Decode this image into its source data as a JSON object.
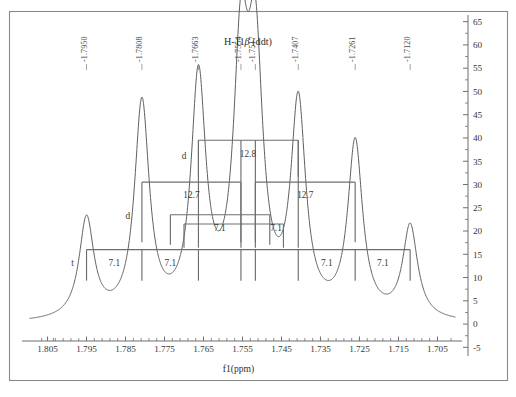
{
  "figure": {
    "title": "",
    "assignment_label": "H-11β (ddt)"
  },
  "axes": {
    "x": {
      "title": "f1(ppm)",
      "tick_labels": [
        "1.805",
        "1.795",
        "1.785",
        "1.775",
        "1.765",
        "1.755",
        "1.745",
        "1.735",
        "1.725",
        "1.715",
        "1.705"
      ],
      "min": 1.8095,
      "max": 1.7005,
      "direction": "reversed",
      "minor_ticks_per_major": 4
    },
    "y": {
      "title": "",
      "tick_labels": [
        "-5",
        "0",
        "5",
        "10",
        "15",
        "20",
        "25",
        "30",
        "35",
        "40",
        "45",
        "50",
        "55",
        "60",
        "65"
      ],
      "min": -6,
      "max": 66,
      "minor_ticks_per_major": 1
    }
  },
  "peak_labels": [
    {
      "text": "-1.7950",
      "ppm": 1.795
    },
    {
      "text": "-1.7808",
      "ppm": 1.7808
    },
    {
      "text": "-1.7663",
      "ppm": 1.7663
    },
    {
      "text": "-1.7554",
      "ppm": 1.7554
    },
    {
      "text": "-1.7517",
      "ppm": 1.7517
    },
    {
      "text": "-1.7407",
      "ppm": 1.7407
    },
    {
      "text": "-1.7261",
      "ppm": 1.7261
    },
    {
      "text": "-1.7120",
      "ppm": 1.712
    }
  ],
  "coupling_tree": {
    "levels": [
      {
        "name": "level-ddt-12.8",
        "multiplicity_letter": "d",
        "j_label": "12.8",
        "left_ppm": 1.7663,
        "right_ppm": 1.7407,
        "bar_y_value": 39.5,
        "stem_drop": 8.5
      },
      {
        "name": "level-d-12.7-left",
        "multiplicity_letter": "d",
        "j_label": "12.7",
        "left_ppm": 1.7808,
        "right_ppm": 1.7554,
        "bar_y_value": 30.5,
        "stem_drop": 14.0
      },
      {
        "name": "level-d-12.7-right",
        "multiplicity_letter": "",
        "j_label": "12.7",
        "left_ppm": 1.7517,
        "right_ppm": 1.7261,
        "bar_y_value": 30.5,
        "stem_drop": 14.0
      },
      {
        "name": "level-t-7.1-inner-left",
        "multiplicity_letter": "",
        "j_label": "7.1",
        "left_ppm": 1.7735,
        "right_ppm": 1.748,
        "bar_y_value": 23.5,
        "stem_drop": 7.0
      },
      {
        "name": "level-t-7.1-inner-right",
        "multiplicity_letter": "",
        "j_label": "7.1",
        "left_ppm": 1.77,
        "right_ppm": 1.7445,
        "bar_y_value": 21.5,
        "stem_drop": 5.5
      }
    ],
    "base_level": {
      "name": "level-t-base",
      "multiplicity_letter": "t",
      "bar_y_value": 16.0,
      "j_labels": [
        "7.1",
        "7.1",
        "7.1",
        "7.1"
      ],
      "stem_ppms": [
        1.795,
        1.7808,
        1.7663,
        1.7554,
        1.7517,
        1.7407,
        1.7261,
        1.712
      ]
    }
  },
  "chart_data": {
    "type": "line",
    "xlabel": "f1(ppm)",
    "ylabel": "",
    "xlim": [
      1.8095,
      1.7005
    ],
    "ylim": [
      -6,
      66
    ],
    "x_reversed": true,
    "grid": false,
    "legend": "none",
    "series": [
      {
        "name": "1H NMR trace",
        "peaks": [
          {
            "ppm": 1.795,
            "intensity": 21.5,
            "label": "-1.7950"
          },
          {
            "ppm": 1.7808,
            "intensity": 46.0,
            "label": "-1.7808"
          },
          {
            "ppm": 1.7663,
            "intensity": 50.5,
            "label": "-1.7663"
          },
          {
            "ppm": 1.7554,
            "intensity": 52.5,
            "label": "-1.7554"
          },
          {
            "ppm": 1.7517,
            "intensity": 52.0,
            "label": "-1.7517"
          },
          {
            "ppm": 1.7407,
            "intensity": 45.0,
            "label": "-1.7407"
          },
          {
            "ppm": 1.7261,
            "intensity": 37.5,
            "label": "-1.7261"
          },
          {
            "ppm": 1.712,
            "intensity": 20.0,
            "label": "-1.7120"
          }
        ],
        "baseline": 0,
        "linewidth_ppm": 0.0023
      }
    ],
    "annotations": [
      {
        "text": "H-11β (ddt)",
        "ppm": 1.7536,
        "value": 60.0
      },
      {
        "text": "12.8",
        "ppm": 1.7536,
        "value": 36.0
      },
      {
        "text": "12.7",
        "ppm": 1.7681,
        "value": 27.0
      },
      {
        "text": "12.7",
        "ppm": 1.7389,
        "value": 27.0
      },
      {
        "text": "7.1",
        "ppm": 1.7608,
        "value": 20.0
      },
      {
        "text": "7.1",
        "ppm": 1.7464,
        "value": 20.0
      },
      {
        "text": "7.1",
        "ppm": 1.7879,
        "value": 12.5
      },
      {
        "text": "7.1",
        "ppm": 1.7735,
        "value": 12.5
      },
      {
        "text": "7.1",
        "ppm": 1.7334,
        "value": 12.5
      },
      {
        "text": "7.1",
        "ppm": 1.719,
        "value": 12.5
      },
      {
        "text": "d",
        "ppm": 1.77,
        "value": 35.5
      },
      {
        "text": "d",
        "ppm": 1.7844,
        "value": 22.5
      },
      {
        "text": "t",
        "ppm": 1.7986,
        "value": 12.5
      }
    ]
  },
  "colors": {
    "trace": "#5f5f5f",
    "tree": "#6e6e6e",
    "frame": "#8a8a8a",
    "text": "#3a3a3a",
    "background": "#ffffff"
  }
}
